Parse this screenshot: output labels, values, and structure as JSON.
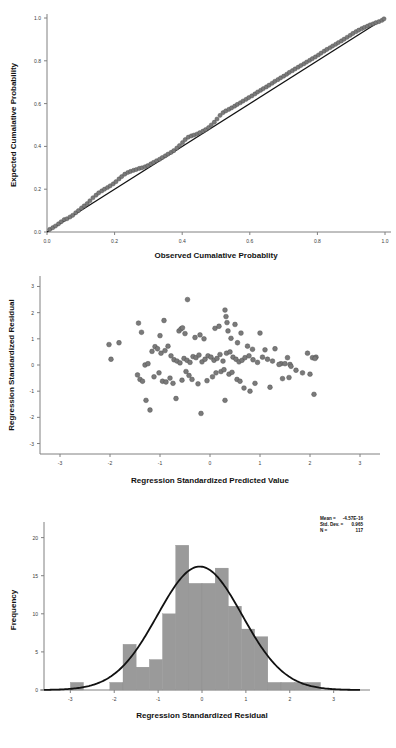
{
  "page": {
    "background": "#ffffff",
    "point_color": "#7a7a7a",
    "line_color": "#111111",
    "bar_color": "#9a9a9a",
    "axis_color": "#808080"
  },
  "chart_data": [
    {
      "id": "pp-plot",
      "type": "scatter",
      "title": "",
      "xlabel": "Observed Cumalative Probablity",
      "ylabel": "Expected Cumalative Probability",
      "xlim": [
        0.0,
        1.0
      ],
      "ylim": [
        0.0,
        1.0
      ],
      "xticks": [
        "0.0",
        "0.2",
        "0.4",
        "0.6",
        "0.8",
        "1.0"
      ],
      "xtick_values": [
        0.0,
        0.2,
        0.4,
        0.6,
        0.8,
        1.0
      ],
      "yticks": [
        "0.0",
        "0.2",
        "0.4",
        "0.6",
        "0.8",
        "1.0"
      ],
      "ytick_values": [
        0.0,
        0.2,
        0.4,
        0.6,
        0.8,
        1.0
      ],
      "grid": false,
      "legend": "none",
      "reference_line": {
        "from": [
          0.0,
          0.0
        ],
        "to": [
          1.0,
          1.0
        ]
      },
      "x": [
        0.008,
        0.017,
        0.025,
        0.034,
        0.042,
        0.051,
        0.059,
        0.068,
        0.076,
        0.085,
        0.093,
        0.102,
        0.11,
        0.119,
        0.127,
        0.136,
        0.145,
        0.153,
        0.162,
        0.17,
        0.179,
        0.187,
        0.196,
        0.204,
        0.213,
        0.221,
        0.23,
        0.239,
        0.247,
        0.256,
        0.264,
        0.273,
        0.281,
        0.29,
        0.298,
        0.307,
        0.315,
        0.324,
        0.333,
        0.341,
        0.35,
        0.358,
        0.367,
        0.375,
        0.384,
        0.392,
        0.401,
        0.409,
        0.418,
        0.427,
        0.435,
        0.444,
        0.452,
        0.461,
        0.469,
        0.478,
        0.486,
        0.495,
        0.503,
        0.512,
        0.521,
        0.529,
        0.538,
        0.546,
        0.555,
        0.563,
        0.572,
        0.58,
        0.589,
        0.597,
        0.606,
        0.615,
        0.623,
        0.632,
        0.64,
        0.649,
        0.657,
        0.666,
        0.674,
        0.683,
        0.691,
        0.7,
        0.709,
        0.717,
        0.726,
        0.734,
        0.743,
        0.751,
        0.76,
        0.768,
        0.777,
        0.785,
        0.794,
        0.803,
        0.811,
        0.82,
        0.828,
        0.837,
        0.845,
        0.854,
        0.862,
        0.871,
        0.879,
        0.888,
        0.897,
        0.905,
        0.914,
        0.922,
        0.931,
        0.939,
        0.948,
        0.956,
        0.965,
        0.973,
        0.982,
        0.991,
        0.997
      ],
      "y": [
        0.012,
        0.02,
        0.028,
        0.038,
        0.048,
        0.058,
        0.062,
        0.07,
        0.078,
        0.09,
        0.1,
        0.112,
        0.122,
        0.133,
        0.146,
        0.16,
        0.172,
        0.183,
        0.192,
        0.2,
        0.208,
        0.216,
        0.225,
        0.235,
        0.248,
        0.259,
        0.27,
        0.278,
        0.283,
        0.288,
        0.292,
        0.297,
        0.3,
        0.305,
        0.31,
        0.318,
        0.325,
        0.333,
        0.34,
        0.348,
        0.356,
        0.364,
        0.372,
        0.38,
        0.392,
        0.404,
        0.418,
        0.432,
        0.443,
        0.449,
        0.453,
        0.458,
        0.464,
        0.471,
        0.478,
        0.488,
        0.5,
        0.513,
        0.528,
        0.545,
        0.558,
        0.566,
        0.573,
        0.58,
        0.588,
        0.596,
        0.604,
        0.612,
        0.62,
        0.628,
        0.636,
        0.645,
        0.654,
        0.662,
        0.67,
        0.678,
        0.686,
        0.695,
        0.704,
        0.712,
        0.72,
        0.728,
        0.737,
        0.746,
        0.754,
        0.762,
        0.77,
        0.778,
        0.786,
        0.794,
        0.802,
        0.81,
        0.818,
        0.827,
        0.836,
        0.845,
        0.853,
        0.861,
        0.869,
        0.877,
        0.885,
        0.893,
        0.901,
        0.91,
        0.919,
        0.928,
        0.936,
        0.943,
        0.95,
        0.956,
        0.962,
        0.968,
        0.973,
        0.978,
        0.983,
        0.989,
        0.996
      ]
    },
    {
      "id": "residual-scatter",
      "type": "scatter",
      "title": "",
      "xlabel": "Regression Standardized Predicted Value",
      "ylabel": "Regression Standardized Residual",
      "xlim": [
        -3.4,
        3.4
      ],
      "ylim": [
        -3.4,
        3.4
      ],
      "xticks": [
        "-3",
        "-2",
        "-1",
        "0",
        "1",
        "2",
        "3"
      ],
      "xtick_values": [
        -3,
        -2,
        -1,
        0,
        1,
        2,
        3
      ],
      "yticks": [
        "-3",
        "-2",
        "-1",
        "0",
        "1",
        "2",
        "3"
      ],
      "ytick_values": [
        -3,
        -2,
        -1,
        0,
        1,
        2,
        3
      ],
      "grid": false,
      "legend": "none",
      "x": [
        -0.45,
        -2.02,
        -1.82,
        -1.98,
        -1.37,
        -1.43,
        -0.92,
        -1.0,
        -0.62,
        -0.58,
        -0.55,
        -0.5,
        -0.3,
        -0.2,
        -0.12,
        0.1,
        0.18,
        0.3,
        0.32,
        0.34,
        0.36,
        0.42,
        0.5,
        0.55,
        0.62,
        0.75,
        0.85,
        1.0,
        1.1,
        1.3,
        1.42,
        1.55,
        1.6,
        1.95,
        2.05,
        2.12,
        -1.3,
        -1.24,
        -1.16,
        -1.1,
        -1.05,
        -0.98,
        -0.9,
        -0.84,
        -0.78,
        -0.72,
        -0.66,
        -0.6,
        -0.52,
        -0.46,
        -0.4,
        -0.34,
        -0.28,
        -0.22,
        -0.16,
        -0.1,
        -0.04,
        0.02,
        0.08,
        0.14,
        0.2,
        0.26,
        0.33,
        0.4,
        0.46,
        0.52,
        0.58,
        0.64,
        0.7,
        0.78,
        0.86,
        0.95,
        1.05,
        1.15,
        1.25,
        1.38,
        1.5,
        1.62,
        1.72,
        1.85,
        2.0,
        2.1,
        -1.45,
        -1.4,
        -1.35,
        -1.28,
        -1.2,
        -1.12,
        -1.02,
        -0.95,
        -0.88,
        -0.8,
        -0.74,
        -0.68,
        -0.56,
        -0.48,
        -0.42,
        -0.36,
        -0.24,
        -0.18,
        -0.06,
        0.05,
        0.12,
        0.22,
        0.28,
        0.38,
        0.44,
        0.54,
        0.6,
        0.68,
        0.8,
        0.9,
        1.2,
        1.45,
        1.58,
        2.08,
        0.3
      ],
      "y": [
        2.5,
        0.78,
        0.85,
        0.22,
        1.25,
        1.6,
        1.7,
        1.12,
        1.3,
        1.38,
        1.42,
        1.2,
        1.05,
        1.15,
        1.0,
        1.4,
        1.48,
        2.1,
        1.85,
        1.62,
        1.3,
        1.02,
        1.55,
        0.85,
        1.22,
        0.72,
        0.6,
        1.22,
        0.58,
        0.62,
        0.05,
        0.28,
        0.02,
        0.45,
        0.28,
        0.3,
        0.0,
        0.05,
        0.52,
        0.7,
        0.62,
        0.45,
        0.55,
        0.72,
        0.35,
        0.2,
        0.15,
        0.08,
        0.25,
        0.18,
        0.1,
        0.32,
        0.28,
        0.38,
        0.12,
        0.22,
        0.35,
        0.3,
        0.18,
        0.25,
        0.4,
        0.15,
        0.45,
        0.5,
        0.3,
        0.22,
        0.12,
        0.18,
        0.28,
        0.35,
        0.2,
        0.1,
        0.3,
        0.22,
        0.15,
        0.02,
        0.05,
        -0.05,
        -0.2,
        -0.3,
        -0.35,
        0.25,
        -0.38,
        -0.55,
        -0.62,
        -1.35,
        -1.72,
        -0.45,
        -0.3,
        -0.62,
        -0.65,
        -0.5,
        -0.7,
        -1.28,
        -0.58,
        -0.25,
        -0.4,
        -0.55,
        -0.72,
        -1.85,
        -0.6,
        -0.45,
        -0.3,
        -0.25,
        -0.18,
        -0.35,
        -0.28,
        -0.55,
        -0.62,
        -0.88,
        -1.0,
        -0.7,
        -0.85,
        -0.52,
        -0.48,
        -1.12,
        -1.35
      ]
    },
    {
      "id": "residual-histogram",
      "type": "bar",
      "title": "",
      "xlabel": "Regression Standardized Residual",
      "ylabel": "Frequency",
      "xlim": [
        -3.6,
        3.6
      ],
      "ylim": [
        0,
        21
      ],
      "xticks": [
        "-3",
        "-2",
        "-1",
        "0",
        "1",
        "2",
        "3"
      ],
      "xtick_values": [
        -3,
        -2,
        -1,
        0,
        1,
        2,
        3
      ],
      "yticks": [
        "0",
        "5",
        "10",
        "15",
        "20"
      ],
      "ytick_values": [
        0,
        5,
        10,
        15,
        20
      ],
      "grid": false,
      "legend": "none",
      "bin_width": 0.3,
      "bin_centers": [
        -2.85,
        -2.55,
        -2.25,
        -1.95,
        -1.65,
        -1.35,
        -1.05,
        -0.75,
        -0.45,
        -0.15,
        0.15,
        0.45,
        0.75,
        1.05,
        1.35,
        1.65,
        1.95,
        2.25,
        2.55
      ],
      "values": [
        1,
        0,
        0,
        1,
        6,
        3,
        4,
        10,
        19,
        14,
        14,
        16,
        11,
        8,
        7,
        1,
        1,
        1,
        1
      ],
      "categories": [
        "-2.85",
        "-2.55",
        "-2.25",
        "-1.95",
        "-1.65",
        "-1.35",
        "-1.05",
        "-0.75",
        "-0.45",
        "-0.15",
        "0.15",
        "0.45",
        "0.75",
        "1.05",
        "1.35",
        "1.65",
        "1.95",
        "2.25",
        "2.55"
      ],
      "normal_curve": {
        "peak": 16.2,
        "mean": -0.05,
        "sd": 0.965
      },
      "annotation": {
        "mean_label": "Mean =",
        "mean_value": "-4.57E-16",
        "sd_label": "Std. Dev. =",
        "sd_value": "0.965",
        "n_label": "N =",
        "n_value": "117"
      }
    }
  ]
}
